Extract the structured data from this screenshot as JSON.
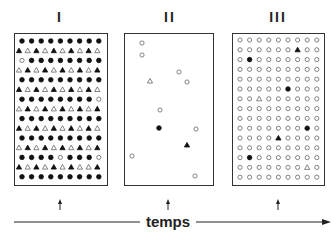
{
  "panels": [
    {
      "label": "I",
      "x": 14,
      "width": 94
    },
    {
      "label": "II",
      "x": 124,
      "width": 90
    },
    {
      "label": "III",
      "x": 232,
      "width": 93
    }
  ],
  "axis": {
    "label": "temps",
    "y": 222,
    "x_start": 14,
    "x_end": 330
  },
  "arrow_marks_x": [
    60,
    168,
    278
  ],
  "legend_symbols": {
    "fc": "filled-circle",
    "oc": "open-circle",
    "ft": "filled-triangle",
    "ot": "open-triangle"
  },
  "panel_I_grid": {
    "rows": [
      "fc fc fc fc fc fc fc fc fc",
      "ft ot ft ot ft ot ft ot ft ot",
      "oc fc fc fc fc fc fc fc fc",
      "ot ft ot ft ot ft ot ft ot ft",
      "fc fc fc fc fc fc fc fc fc",
      "ft ot ft ot ft ot ft ot ft ot",
      "fc fc fc fc fc fc fc fc oc",
      "ot ft ot ft ot ft ot ft ot ft",
      "fc fc fc fc fc fc fc fc fc",
      "ft ot ft ot ft ot ft ot ft ot",
      "fc fc fc fc fc fc fc fc fc",
      "ot ft ot ft ot ft ot ft ot ft",
      "fc fc fc fc oc fc fc fc oc",
      "ft ot ft ot ft ot ft ot ot ft",
      "fc fc fc fc fc fc fc fc fc"
    ]
  },
  "panel_II_points": [
    {
      "t": "oc",
      "x": 142,
      "y": 43
    },
    {
      "t": "oc",
      "x": 142,
      "y": 55
    },
    {
      "t": "oc",
      "x": 179,
      "y": 72
    },
    {
      "t": "ot",
      "x": 150,
      "y": 81
    },
    {
      "t": "oc",
      "x": 187,
      "y": 82
    },
    {
      "t": "oc",
      "x": 160,
      "y": 110
    },
    {
      "t": "fc",
      "x": 159,
      "y": 128
    },
    {
      "t": "oc",
      "x": 196,
      "y": 129
    },
    {
      "t": "ft",
      "x": 187,
      "y": 145
    },
    {
      "t": "oc",
      "x": 132,
      "y": 156
    },
    {
      "t": "oc",
      "x": 195,
      "y": 176
    }
  ],
  "panel_III_grid": {
    "cols": 9,
    "rows": 15,
    "default": "oc",
    "exceptions": [
      {
        "r": 1,
        "c": 6,
        "t": "ft"
      },
      {
        "r": 2,
        "c": 1,
        "t": "fc"
      },
      {
        "r": 5,
        "c": 5,
        "t": "fc"
      },
      {
        "r": 6,
        "c": 2,
        "t": "ot"
      },
      {
        "r": 9,
        "c": 7,
        "t": "fc"
      },
      {
        "r": 10,
        "c": 4,
        "t": "ft"
      },
      {
        "r": 12,
        "c": 1,
        "t": "fc"
      },
      {
        "r": 13,
        "c": 7,
        "t": "ot"
      }
    ]
  }
}
